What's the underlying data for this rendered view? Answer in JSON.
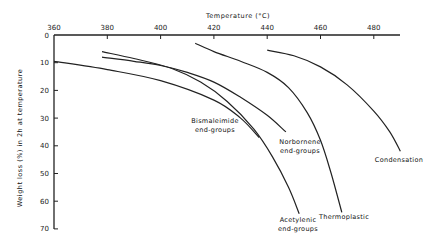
{
  "chart_data": {
    "type": "line",
    "title": "",
    "xlabel": "Temperature (°C)",
    "ylabel": "Weight loss (%) in 2h at temperature",
    "xlim": [
      360,
      490
    ],
    "ylim": [
      0,
      70
    ],
    "y_inverted": true,
    "x_axis_position": "top",
    "grid": false,
    "legend": "inline labels",
    "x_ticks": [
      360,
      380,
      400,
      420,
      440,
      460,
      480
    ],
    "y_ticks": [
      0,
      10,
      20,
      30,
      40,
      50,
      60,
      70
    ],
    "series": [
      {
        "name": "Bismaleimide end-groups",
        "label_lines": [
          "Bismaleimide",
          "end-groups"
        ],
        "points": [
          [
            360,
            9.5
          ],
          [
            380,
            12.5
          ],
          [
            400,
            16.5
          ],
          [
            420,
            23.5
          ],
          [
            430,
            30
          ],
          [
            437,
            37
          ]
        ]
      },
      {
        "name": "Norbornene end-groups",
        "label_lines": [
          "Norbornene",
          "end-groups"
        ],
        "points": [
          [
            378,
            8
          ],
          [
            390,
            9.5
          ],
          [
            400,
            11
          ],
          [
            410,
            13.5
          ],
          [
            420,
            17
          ],
          [
            430,
            22.5
          ],
          [
            440,
            29
          ],
          [
            447,
            35
          ]
        ]
      },
      {
        "name": "Acetylenic end-groups",
        "label_lines": [
          "Acetylenic",
          "end-groups"
        ],
        "points": [
          [
            378,
            6
          ],
          [
            390,
            8.5
          ],
          [
            404,
            12
          ],
          [
            415,
            17
          ],
          [
            425,
            24
          ],
          [
            435,
            34
          ],
          [
            442,
            44
          ],
          [
            448,
            55
          ],
          [
            452,
            64.5
          ]
        ]
      },
      {
        "name": "Thermoplastic",
        "label_lines": [
          "Thermoplastic"
        ],
        "points": [
          [
            413,
            3
          ],
          [
            420,
            6
          ],
          [
            430,
            9.5
          ],
          [
            440,
            13.5
          ],
          [
            448,
            19
          ],
          [
            455,
            28
          ],
          [
            460,
            38
          ],
          [
            464,
            50
          ],
          [
            468,
            64
          ]
        ]
      },
      {
        "name": "Condensation",
        "label_lines": [
          "Condensation"
        ],
        "points": [
          [
            440,
            5.5
          ],
          [
            450,
            7.5
          ],
          [
            460,
            11.5
          ],
          [
            470,
            18
          ],
          [
            480,
            27.5
          ],
          [
            486,
            35
          ],
          [
            490,
            42
          ]
        ]
      }
    ]
  },
  "labels": {
    "x_axis_title": "Temperature (°C)",
    "y_axis_title": "Weight loss (%) in 2h at temperature"
  }
}
